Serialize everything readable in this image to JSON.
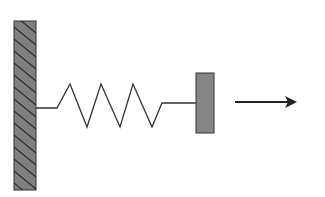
{
  "diagram": {
    "title": "Spring-mass system attached to a fixed wall",
    "colors": {
      "background": "#ffffff",
      "wall_fill": "#7f7f7f",
      "wall_hatch": "#2a2a2a",
      "block_fill": "#858585",
      "stroke": "#333333",
      "arrow": "#222222"
    },
    "elements": {
      "wall": {
        "label": "fixed wall (hatched)",
        "x": 14,
        "y": 21,
        "width": 22,
        "height": 169
      },
      "spring": {
        "label": "spring",
        "points": [
          [
            36,
            108
          ],
          [
            57,
            108
          ],
          [
            70,
            84
          ],
          [
            87,
            127
          ],
          [
            101,
            84
          ],
          [
            120,
            127
          ],
          [
            133,
            84
          ],
          [
            152,
            127
          ],
          [
            162,
            103
          ],
          [
            196,
            103
          ]
        ],
        "coils": 3
      },
      "block": {
        "label": "block (mass)",
        "x": 196,
        "y": 73,
        "width": 18,
        "height": 60
      },
      "arrow": {
        "label": "direction of displacement / force (right)",
        "x1": 235,
        "y1": 102,
        "x2": 297,
        "y2": 102,
        "direction": "right"
      }
    }
  }
}
